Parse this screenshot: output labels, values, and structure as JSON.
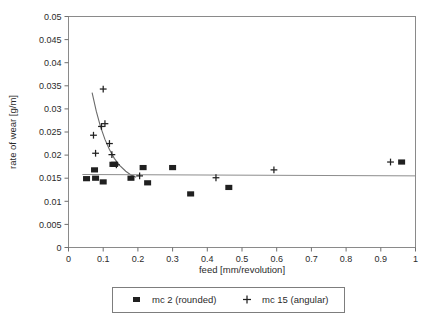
{
  "chart_data": {
    "type": "scatter",
    "title": "",
    "xlabel": "feed [mm/revolution]",
    "ylabel": "rate of wear [g/m]",
    "xlim": [
      0,
      1
    ],
    "ylim": [
      0,
      0.05
    ],
    "grid": false,
    "legend_position": "bottom",
    "x_ticks": [
      "0",
      "0.1",
      "0.2",
      "0.3",
      "0.4",
      "0.5",
      "0.6",
      "0.7",
      "0.8",
      "0.9",
      "1"
    ],
    "x_tick_values": [
      0,
      0.1,
      0.2,
      0.3,
      0.4,
      0.5,
      0.6,
      0.7,
      0.8,
      0.9,
      1
    ],
    "y_ticks": [
      "0",
      "0.005",
      "0.01",
      "0.015",
      "0.02",
      "0.025",
      "0.03",
      "0.035",
      "0.04",
      "0.045",
      "0.05"
    ],
    "y_tick_values": [
      0,
      0.005,
      0.01,
      0.015,
      0.02,
      0.025,
      0.03,
      0.035,
      0.04,
      0.045,
      0.05
    ],
    "series": [
      {
        "name": "mc 2 (rounded)",
        "marker": "square",
        "color": "#202020",
        "points": [
          [
            0.052,
            0.0149
          ],
          [
            0.075,
            0.0168
          ],
          [
            0.078,
            0.015
          ],
          [
            0.1,
            0.0142
          ],
          [
            0.128,
            0.018
          ],
          [
            0.133,
            0.018
          ],
          [
            0.18,
            0.015
          ],
          [
            0.215,
            0.0173
          ],
          [
            0.228,
            0.014
          ],
          [
            0.3,
            0.0173
          ],
          [
            0.352,
            0.0116
          ],
          [
            0.462,
            0.013
          ],
          [
            0.96,
            0.0185
          ]
        ]
      },
      {
        "name": "mc 15 (angular)",
        "marker": "plus",
        "color": "#202020",
        "points": [
          [
            0.072,
            0.0243
          ],
          [
            0.078,
            0.0204
          ],
          [
            0.095,
            0.0262
          ],
          [
            0.1,
            0.0343
          ],
          [
            0.105,
            0.0268
          ],
          [
            0.118,
            0.0225
          ],
          [
            0.125,
            0.0201
          ],
          [
            0.138,
            0.0179
          ],
          [
            0.205,
            0.0155
          ],
          [
            0.425,
            0.0151
          ],
          [
            0.592,
            0.0168
          ],
          [
            0.928,
            0.0185
          ]
        ]
      }
    ],
    "fits": [
      {
        "name": "mc 15 decay fit",
        "type": "curve",
        "points": [
          [
            0.068,
            0.0335
          ],
          [
            0.08,
            0.0295
          ],
          [
            0.092,
            0.0262
          ],
          [
            0.105,
            0.0234
          ],
          [
            0.118,
            0.0212
          ],
          [
            0.132,
            0.0193
          ],
          [
            0.148,
            0.0177
          ],
          [
            0.165,
            0.0165
          ],
          [
            0.18,
            0.0157
          ],
          [
            0.195,
            0.0152
          ]
        ]
      },
      {
        "name": "mc 2 horizontal fit",
        "type": "line",
        "points": [
          [
            0.04,
            0.0158
          ],
          [
            1.0,
            0.0155
          ]
        ]
      }
    ]
  },
  "legend": {
    "entries": [
      {
        "label": "mc 2 (rounded)",
        "marker": "square"
      },
      {
        "label": "mc 15 (angular)",
        "marker": "plus"
      }
    ]
  }
}
